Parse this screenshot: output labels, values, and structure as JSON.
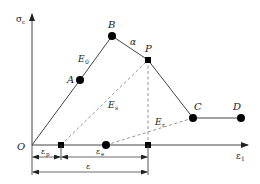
{
  "diagram": {
    "title": "",
    "axes": {
      "y_label": "σ",
      "y_label_sub": "c",
      "x_label": "ε",
      "x_label_sub": "1",
      "origin_label": "O"
    },
    "points": [
      {
        "id": "A",
        "label": "A",
        "marker": "circle"
      },
      {
        "id": "B",
        "label": "B",
        "marker": "circle"
      },
      {
        "id": "P",
        "label": "P",
        "marker": "square"
      },
      {
        "id": "C",
        "label": "C",
        "marker": "circle"
      },
      {
        "id": "D",
        "label": "D",
        "marker": "circle"
      }
    ],
    "segment_labels": {
      "E0": "E",
      "E0_sub": "0",
      "alpha": "α",
      "Es": "E",
      "Es_sub": "s",
      "Er": "E",
      "Er_sub": "r"
    },
    "dimensions": {
      "eps_p": "ε",
      "eps_p_sub": "p",
      "eps_e": "ε",
      "eps_e_sub": "e",
      "eps": "ε"
    },
    "colors": {
      "line": "#333333",
      "dashed": "#888888",
      "marker": "#000000"
    }
  }
}
